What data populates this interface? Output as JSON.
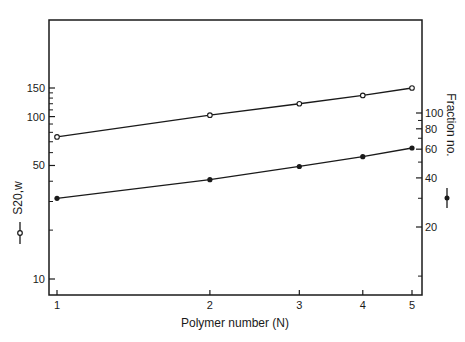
{
  "chart_data": {
    "type": "line",
    "title": "",
    "xlabel": "Polymer number (N)",
    "ylabel_left": "S20,w",
    "ylabel_right": "Fraction no.",
    "x_scale": "log",
    "y_scale": "log",
    "x_ticks": [
      "1",
      "2",
      "3",
      "4",
      "5"
    ],
    "y_left_ticks": [
      "10",
      "50",
      "100",
      "150"
    ],
    "y_right_ticks": [
      "20",
      "40",
      "60",
      "80",
      "100"
    ],
    "x": [
      1,
      2,
      3,
      4,
      5
    ],
    "series": [
      {
        "name": "S20,w",
        "marker": "open-circle",
        "axis": "left",
        "values": [
          75,
          102,
          120,
          135,
          150
        ]
      },
      {
        "name": "Fraction no.",
        "marker": "filled-circle",
        "axis": "right",
        "values": [
          30,
          39,
          47,
          54,
          61
        ]
      }
    ],
    "grid": false,
    "legend": "axis-label markers (open circle = S20,w; filled circle = Fraction no.)"
  }
}
